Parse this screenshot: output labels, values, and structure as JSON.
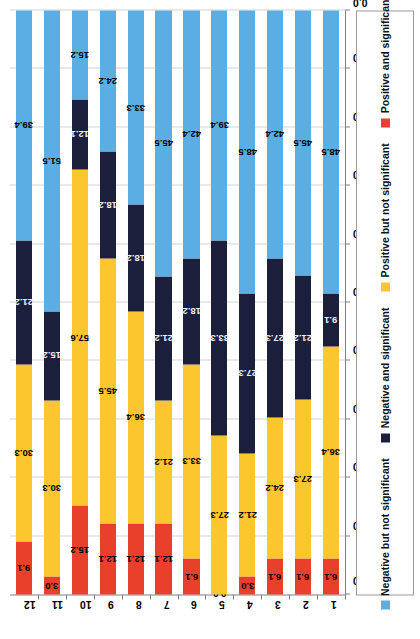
{
  "chart_data": {
    "type": "bar",
    "orientation": "horizontal-stacked-100",
    "title": "",
    "subtitle": "",
    "xlabel": "",
    "ylabel": "",
    "xlim": [
      100.0,
      0.0
    ],
    "axis_inverted": true,
    "grid": true,
    "legend_position": "bottom",
    "tick_labels": [
      "100.0",
      "90.0",
      "80.0",
      "70.0",
      "60.0",
      "50.0",
      "40.0",
      "30.0",
      "20.0",
      "10.0",
      "0.0"
    ],
    "tick_values": [
      100.0,
      90.0,
      80.0,
      70.0,
      60.0,
      50.0,
      40.0,
      30.0,
      20.0,
      10.0,
      0.0
    ],
    "categories": [
      "1",
      "2",
      "3",
      "4",
      "5",
      "6",
      "7",
      "8",
      "9",
      "10",
      "11",
      "12"
    ],
    "series": [
      {
        "name": "Positive and significant",
        "color": "#E8402A",
        "values": [
          6.1,
          6.1,
          6.1,
          3.0,
          0.0,
          6.1,
          12.1,
          12.1,
          12.1,
          15.2,
          3.0,
          9.1
        ],
        "labels": [
          "6.1",
          "6.1",
          "6.1",
          "3.0",
          "0.0",
          "6.1",
          "12.1",
          "12.1",
          "12.1",
          "15.2",
          "3.0",
          "9.1"
        ]
      },
      {
        "name": "Positive but not significant",
        "color": "#FCC62E",
        "values": [
          36.4,
          27.3,
          24.2,
          21.2,
          27.3,
          33.3,
          21.2,
          36.4,
          45.5,
          57.6,
          30.3,
          30.3
        ],
        "labels": [
          "36.4",
          "27.3",
          "24.2",
          "21.2",
          "27.3",
          "33.3",
          "21.2",
          "36.4",
          "45.5",
          "57.6",
          "30.3",
          "30.3"
        ]
      },
      {
        "name": "Negative and significant",
        "color": "#1C1F3B",
        "values": [
          9.1,
          21.2,
          27.3,
          27.3,
          33.3,
          18.2,
          21.2,
          18.2,
          18.2,
          12.1,
          15.2,
          21.2
        ],
        "labels": [
          "9.1",
          "21.2",
          "27.3",
          "27.3",
          "33.3",
          "18.2",
          "21.2",
          "18.2",
          "18.2",
          "12.1",
          "15.2",
          "21.2"
        ]
      },
      {
        "name": "Negative but not significant",
        "color": "#5BAEE3",
        "values": [
          48.5,
          45.5,
          42.4,
          48.5,
          39.4,
          42.4,
          45.5,
          33.3,
          24.2,
          15.2,
          51.5,
          39.4
        ],
        "labels": [
          "48.5",
          "45.5",
          "42.4",
          "48.5",
          "39.4",
          "42.4",
          "45.5",
          "33.3",
          "24.2",
          "15.2",
          "51.5",
          "39.4"
        ]
      }
    ],
    "legend": [
      {
        "label": "Negative but not significant",
        "color": "#5BAEE3"
      },
      {
        "label": "Negative and significant",
        "color": "#1C1F3B"
      },
      {
        "label": "Positive but not significant",
        "color": "#FCC62E"
      },
      {
        "label": "Positive and significant",
        "color": "#E8402A"
      }
    ]
  }
}
